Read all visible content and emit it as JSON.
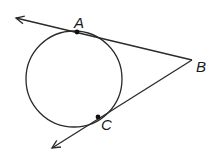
{
  "diagram": {
    "colors": {
      "stroke": "#2a2a2a",
      "point": "#111111",
      "label": "#1a1a1a",
      "background": "#ffffff"
    },
    "circle": {
      "cx": 74,
      "cy": 79,
      "r": 48
    },
    "points": {
      "A": {
        "label": "A",
        "x": 77,
        "y": 32
      },
      "B": {
        "label": "B",
        "x": 192,
        "y": 60
      },
      "C": {
        "label": "C",
        "x": 98,
        "y": 117
      }
    },
    "rays": [
      {
        "name": "ray-BA",
        "from": "B",
        "through": "A",
        "arrow_tip": {
          "x": 16,
          "y": 18
        }
      },
      {
        "name": "ray-BC",
        "from": "B",
        "through": "C",
        "arrow_tip": {
          "x": 52,
          "y": 148
        }
      }
    ],
    "labels": [
      {
        "name": "label-A",
        "text": "A",
        "x": 74,
        "y": 28
      },
      {
        "name": "label-B",
        "text": "B",
        "x": 196,
        "y": 72
      },
      {
        "name": "label-C",
        "text": "C",
        "x": 101,
        "y": 130
      }
    ]
  }
}
